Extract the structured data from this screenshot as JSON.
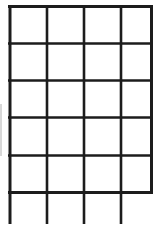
{
  "document": {
    "kind": "blank-grid-table",
    "title": "",
    "background_color": "#ffffff",
    "line_color": "#1c1c1c",
    "edge_artifact_color": "#d8d8d8"
  },
  "grid": {
    "columns": 4,
    "full_rows": 5,
    "partial_rows": 1,
    "total_row_bands": 6,
    "bottom_row_cut_off": true,
    "has_bottom_border": false,
    "x_positions": [
      10,
      47,
      84,
      121,
      152
    ],
    "y_positions": [
      6,
      43,
      80,
      117,
      155,
      192
    ],
    "bottom_cut_y": 224,
    "column_width": 37,
    "row_height": 37,
    "line_width": 2.6,
    "outer_line_width": 3.0,
    "top_border_x_start": 8,
    "top_border_x_end": 153
  },
  "cells": {
    "row_labels": [
      "row-1",
      "row-2",
      "row-3",
      "row-4",
      "row-5",
      "row-6-partial"
    ],
    "column_labels": [
      "col-1",
      "col-2",
      "col-3",
      "col-4"
    ],
    "values": [
      [
        "",
        "",
        "",
        ""
      ],
      [
        "",
        "",
        "",
        ""
      ],
      [
        "",
        "",
        "",
        ""
      ],
      [
        "",
        "",
        "",
        ""
      ],
      [
        "",
        "",
        "",
        ""
      ],
      [
        "",
        "",
        "",
        ""
      ]
    ]
  },
  "artifacts": {
    "left_edge_streak": {
      "x": 0,
      "y": 104,
      "width": 2,
      "height": 52
    }
  }
}
